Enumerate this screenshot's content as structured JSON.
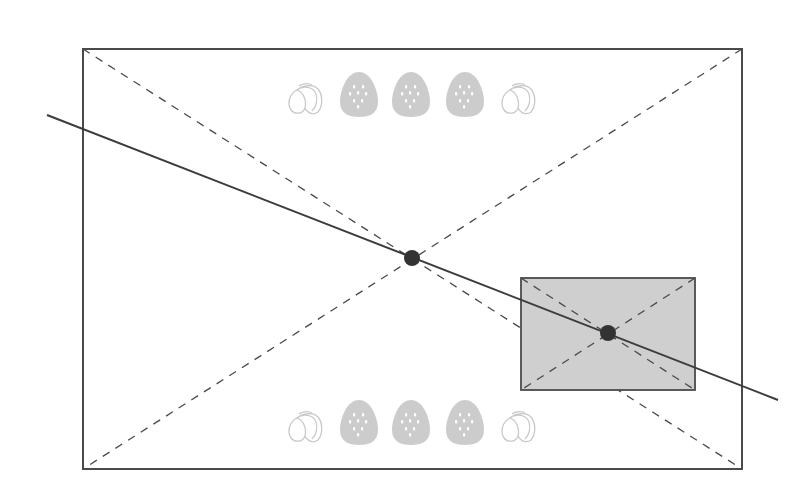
{
  "diagram": {
    "colors": {
      "background": "#ffffff",
      "frame_stroke": "#4a4a4a",
      "dashed_stroke": "#4a4a4a",
      "solid_line": "#3c3c3c",
      "inner_fill": "#cfcfcf",
      "inner_stroke": "#4a4a4a",
      "dot_fill": "#333333",
      "icon_fill": "#cccccc",
      "icon_outline": "#c8c8c8",
      "seed_color": "#ffffff"
    },
    "outer_frame": {
      "x1": 83,
      "y1": 49,
      "x2": 742,
      "y2": 469
    },
    "inner_rect": {
      "x1": 521,
      "y1": 278,
      "x2": 695,
      "y2": 390
    },
    "solid_line": {
      "x1": 47,
      "y1": 115,
      "x2": 778,
      "y2": 400
    },
    "center_points": [
      {
        "label": "outer-center",
        "cx": 412,
        "cy": 258,
        "r": 8
      },
      {
        "label": "inner-center",
        "cx": 608,
        "cy": 333,
        "r": 8
      }
    ],
    "icon_rows": [
      {
        "position": "top",
        "icons": [
          {
            "type": "swirl",
            "x": 287,
            "y": 82,
            "mirror": false
          },
          {
            "type": "strawberry",
            "x": 340,
            "y": 72
          },
          {
            "type": "strawberry",
            "x": 392,
            "y": 72
          },
          {
            "type": "strawberry",
            "x": 446,
            "y": 72
          },
          {
            "type": "swirl",
            "x": 500,
            "y": 82,
            "mirror": false
          }
        ]
      },
      {
        "position": "bottom",
        "icons": [
          {
            "type": "swirl",
            "x": 287,
            "y": 410,
            "mirror": false
          },
          {
            "type": "strawberry",
            "x": 340,
            "y": 400
          },
          {
            "type": "strawberry",
            "x": 392,
            "y": 400
          },
          {
            "type": "strawberry",
            "x": 446,
            "y": 400
          },
          {
            "type": "swirl",
            "x": 500,
            "y": 410,
            "mirror": false
          }
        ]
      }
    ]
  }
}
